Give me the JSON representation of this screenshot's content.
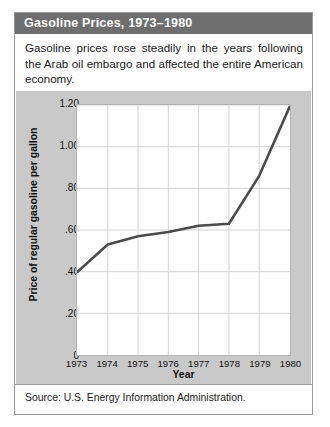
{
  "card": {
    "title": "Gasoline Prices, 1973–1980",
    "intro": "Gasoline prices rose steadily in the years following the Arab oil embargo and affected the entire American economy.",
    "source": "Source: U.S. Energy Information Administration."
  },
  "chart_data": {
    "type": "line",
    "title": "Gasoline Prices, 1973–1980",
    "xlabel": "Year",
    "ylabel": "Price of regular gasoline per gallon",
    "categories": [
      "1973",
      "1974",
      "1975",
      "1976",
      "1977",
      "1978",
      "1979",
      "1980"
    ],
    "values": [
      0.4,
      0.53,
      0.57,
      0.59,
      0.62,
      0.63,
      0.86,
      1.19
    ],
    "ylim": [
      0,
      1.2
    ],
    "yticks": [
      0,
      0.2,
      0.4,
      0.6,
      0.8,
      1.0,
      1.2
    ],
    "ytick_labels": [
      "0",
      ".20",
      ".40",
      ".60",
      ".80",
      "1.00",
      "1.20"
    ],
    "grid": true,
    "legend": "none",
    "line_color": "#4a4a4a"
  }
}
